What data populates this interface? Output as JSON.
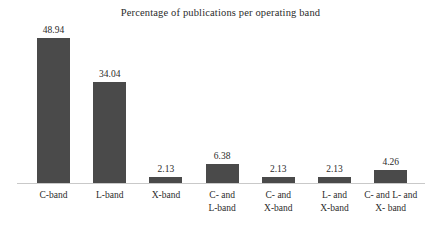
{
  "chart_data": {
    "type": "bar",
    "title": "Percentage of publications per operating band",
    "xlabel": "",
    "ylabel": "",
    "ylim": [
      0,
      48.94
    ],
    "grid": false,
    "legend": false,
    "bar_color": "#4a4a4a",
    "axis_color": "#c9c9c9",
    "text_color": "#2b2b2b",
    "background": "#ffffff",
    "categories": [
      "C-band",
      "L-band",
      "X-band",
      "C- and L-band",
      "C- and X-band",
      "L- and X-band",
      "C- and L- and X- band"
    ],
    "category_lines": [
      [
        "C-band"
      ],
      [
        "L-band"
      ],
      [
        "X-band"
      ],
      [
        "C- and",
        "L-band"
      ],
      [
        "C- and",
        "X-band"
      ],
      [
        "L- and",
        "X-band"
      ],
      [
        "C- and L- and",
        "X- band"
      ]
    ],
    "values": [
      48.94,
      34.04,
      2.13,
      6.38,
      2.13,
      2.13,
      4.26
    ],
    "value_labels": [
      "48.94",
      "34.04",
      "2.13",
      "6.38",
      "2.13",
      "2.13",
      "4.26"
    ]
  }
}
